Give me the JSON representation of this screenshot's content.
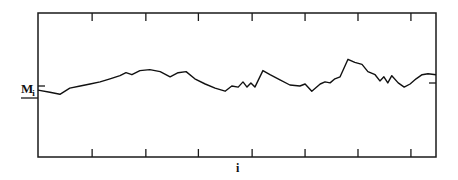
{
  "chart_data": {
    "type": "line",
    "title": "",
    "xlabel": "i",
    "ylabel": "M",
    "ylabel_subscript": "i",
    "xlim": [
      0,
      100
    ],
    "ylim": [
      -7,
      7
    ],
    "grid": false,
    "x_ticks": [
      13.6,
      27.1,
      40.3,
      53.8,
      67.1,
      80.4,
      93.7
    ],
    "reference_level": 0,
    "series": [
      {
        "name": "M_i",
        "x": [
          0,
          3,
          5.5,
          8,
          10.6,
          13.1,
          15.6,
          18.1,
          20.6,
          22.1,
          23.6,
          25.6,
          28.1,
          30.7,
          33.2,
          35.2,
          37.2,
          39.4,
          42,
          44.5,
          47,
          48.7,
          50.3,
          51.5,
          52.5,
          53.5,
          54.5,
          56.5,
          58.3,
          60.8,
          63.3,
          65.8,
          67.1,
          68.8,
          70.9,
          72.1,
          73.4,
          74.6,
          75.9,
          77.9,
          79.6,
          81.4,
          82.9,
          84.7,
          85.9,
          86.9,
          87.9,
          88.9,
          90.5,
          92,
          93.5,
          95,
          96.5,
          98,
          100
        ],
        "y": [
          -0.5,
          -0.7,
          -0.9,
          -0.3,
          -0.1,
          0.1,
          0.3,
          0.6,
          0.9,
          1.2,
          1.0,
          1.4,
          1.5,
          1.3,
          0.8,
          1.2,
          1.3,
          0.6,
          0.1,
          -0.3,
          -0.6,
          -0.1,
          -0.2,
          0.3,
          -0.2,
          0.2,
          -0.2,
          1.4,
          1.0,
          0.5,
          0.0,
          -0.1,
          0.1,
          -0.6,
          0.1,
          0.3,
          0.2,
          0.6,
          0.8,
          2.5,
          2.2,
          2.0,
          1.3,
          1.0,
          0.4,
          0.8,
          0.2,
          0.9,
          0.2,
          -0.2,
          0.1,
          0.6,
          1.0,
          1.1,
          1.0
        ]
      }
    ]
  }
}
